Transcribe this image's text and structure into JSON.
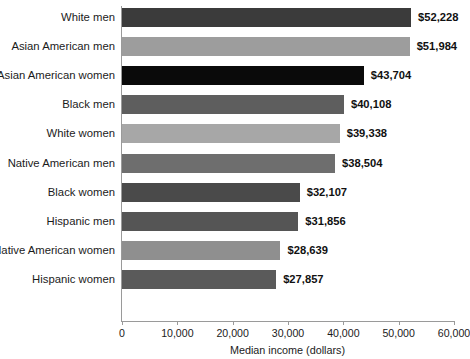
{
  "chart_data": {
    "type": "bar",
    "orientation": "horizontal",
    "title": "",
    "xlabel": "Median income (dollars)",
    "ylabel": "",
    "xlim": [
      0,
      60000
    ],
    "grid": false,
    "legend": null,
    "xticks": [
      0,
      10000,
      20000,
      30000,
      40000,
      50000,
      60000
    ],
    "xtick_labels": [
      "0",
      "10,000",
      "20,000",
      "30,000",
      "40,000",
      "50,000",
      "60,000"
    ],
    "categories": [
      "White men",
      "Asian American men",
      "Asian American women",
      "Black men",
      "White women",
      "Native American men",
      "Black women",
      "Hispanic men",
      "Native American women",
      "Hispanic women"
    ],
    "values": [
      52228,
      51984,
      43704,
      40108,
      39338,
      38504,
      32107,
      31856,
      28639,
      27857
    ],
    "value_labels": [
      "$52,228",
      "$51,984",
      "$43,704",
      "$40,108",
      "$39,338",
      "$38,504",
      "$32,107",
      "$31,856",
      "$28,639",
      "$27,857"
    ],
    "bar_colors": [
      "#3b3b3b",
      "#9d9d9d",
      "#0a0a0a",
      "#5e5e5e",
      "#a7a7a7",
      "#6e6e6e",
      "#4a4a4a",
      "#555555",
      "#8f8f8f",
      "#5a5a5a"
    ],
    "axis_color": "#9a9a9a",
    "text_color": "#1b1b1b",
    "background": "#ffffff"
  }
}
